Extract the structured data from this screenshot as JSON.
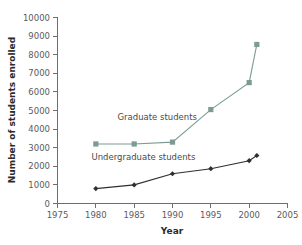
{
  "chart_data": {
    "type": "line",
    "title": "",
    "xlabel": "Year",
    "ylabel": "Number of students enrolled",
    "xlim": [
      1975,
      2005
    ],
    "ylim": [
      0,
      10000
    ],
    "x_ticks": [
      1975,
      1980,
      1985,
      1990,
      1995,
      2000,
      2005
    ],
    "y_ticks": [
      0,
      1000,
      2000,
      3000,
      4000,
      5000,
      6000,
      7000,
      8000,
      9000,
      10000
    ],
    "grid": false,
    "legend": "inline-annotations",
    "series": [
      {
        "name": "Graduate students",
        "color": "#7d9b95",
        "marker": "square",
        "x": [
          1980,
          1985,
          1990,
          1995,
          2000,
          2001
        ],
        "values": [
          3200,
          3200,
          3300,
          5050,
          6500,
          8550
        ]
      },
      {
        "name": "Undergraduate students",
        "color": "#2f2f2f",
        "marker": "diamond",
        "x": [
          1980,
          1985,
          1990,
          1995,
          2000,
          2001
        ],
        "values": [
          800,
          1000,
          1600,
          1870,
          2300,
          2580
        ]
      }
    ],
    "annotations": [
      {
        "text": "Graduate students",
        "x": 1988.0,
        "y": 4500
      },
      {
        "text": "Undergraduate students",
        "x": 1986.2,
        "y": 2350
      }
    ]
  },
  "axis": {
    "y_title": "Number of students enrolled",
    "x_title": "Year",
    "y_tick_labels": [
      "10000",
      "9000",
      "8000",
      "7000",
      "6000",
      "5000",
      "4000",
      "3000",
      "2000",
      "1000",
      "0"
    ],
    "x_tick_labels": [
      "1975",
      "1980",
      "1985",
      "1990",
      "1995",
      "2000",
      "2005"
    ]
  },
  "annotations": {
    "graduate_label": "Graduate students",
    "undergraduate_label": "Undergraduate students"
  },
  "colors": {
    "graduate": "#7d9b95",
    "undergraduate": "#2f2f2f",
    "axis": "#6e6e6e",
    "text": "#4a4a4a",
    "background": "#ffffff"
  }
}
